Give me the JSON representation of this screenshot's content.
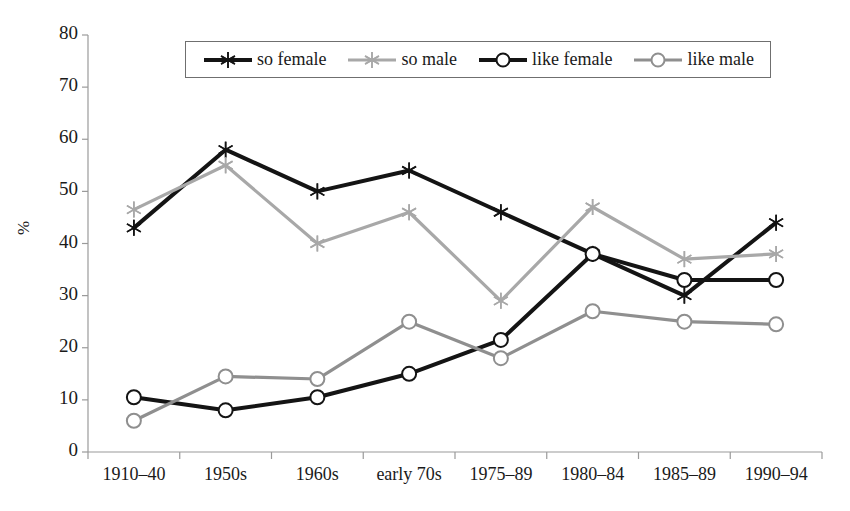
{
  "chart_data": {
    "type": "line",
    "title": "",
    "xlabel": "",
    "ylabel": "%",
    "ylim": [
      0,
      80
    ],
    "ytick_step": 10,
    "yticks": [
      0,
      10,
      20,
      30,
      40,
      50,
      60,
      70,
      80
    ],
    "grid": false,
    "legend_position": "top-center",
    "categories": [
      "1910–40",
      "1950s",
      "1960s",
      "early 70s",
      "1975–89",
      "1980–84",
      "1985–89",
      "1990–94"
    ],
    "series": [
      {
        "name": "so female",
        "color": "#141414",
        "marker": "star",
        "values": [
          43,
          58,
          50,
          54,
          46,
          38,
          30,
          44
        ]
      },
      {
        "name": "so male",
        "color": "#a8a8a8",
        "marker": "star",
        "values": [
          46.5,
          55,
          40,
          46,
          29,
          47,
          37,
          38
        ]
      },
      {
        "name": "like female",
        "color": "#141414",
        "marker": "circle",
        "values": [
          10.5,
          8,
          10.5,
          15,
          21.5,
          38,
          33,
          33
        ]
      },
      {
        "name": "like male",
        "color": "#8f8f8f",
        "marker": "circle",
        "values": [
          6,
          14.5,
          14,
          25,
          18,
          27,
          25,
          24.5
        ]
      }
    ]
  },
  "axes": {
    "y_title": "%",
    "y_labels": [
      "80",
      "70",
      "60",
      "50",
      "40",
      "30",
      "20",
      "10",
      "0"
    ],
    "x_labels": [
      "1910–40",
      "1950s",
      "1960s",
      "early 70s",
      "1975–89",
      "1980–84",
      "1985–89",
      "1990–94"
    ]
  },
  "legend": {
    "entries": [
      {
        "label": "so female",
        "color": "#141414",
        "marker": "star"
      },
      {
        "label": "so male",
        "color": "#a8a8a8",
        "marker": "star"
      },
      {
        "label": "like female",
        "color": "#141414",
        "marker": "circle"
      },
      {
        "label": "like male",
        "color": "#8f8f8f",
        "marker": "circle"
      }
    ]
  },
  "colors": {
    "axis": "#9a9a9a",
    "text": "#1a1a1a",
    "series_dark": "#141414",
    "series_light": "#a8a8a8",
    "background": "#ffffff"
  }
}
